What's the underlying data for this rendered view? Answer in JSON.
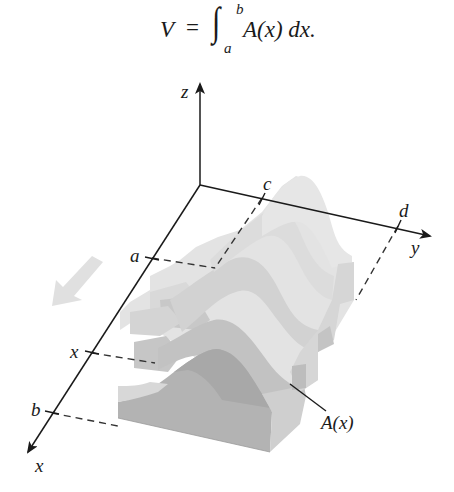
{
  "formula": {
    "lhs": "V",
    "equals": "=",
    "integral_sign": "∫",
    "upper_limit": "b",
    "lower_limit": "a",
    "integrand": "A(x) dx."
  },
  "axes": {
    "z_label": "z",
    "y_label": "y",
    "x_label": "x"
  },
  "ticks": {
    "a": "a",
    "b": "b",
    "x": "x",
    "c": "c",
    "d": "d"
  },
  "annotations": {
    "cross_section": "A(x)"
  },
  "colors": {
    "axis": "#1a1a1a",
    "solid_light": "#e2e2e2",
    "solid_mid": "#cfcfcf",
    "solid_dark": "#a9a9a9",
    "solid_front": "#b4b4b4",
    "motion_arrow": "#dedede"
  }
}
